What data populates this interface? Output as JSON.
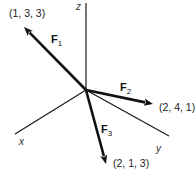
{
  "diagram": {
    "type": "3d-force-vectors",
    "origin": [
      86,
      90
    ],
    "axes": [
      {
        "name": "z",
        "label": "z",
        "end": [
          86,
          3
        ],
        "label_pos": [
          76,
          10
        ]
      },
      {
        "name": "x",
        "label": "x",
        "end": [
          15,
          134
        ],
        "label_pos": [
          19,
          145
        ]
      },
      {
        "name": "y",
        "label": "y",
        "end": [
          169,
          136
        ],
        "label_pos": [
          156,
          152
        ]
      }
    ],
    "vectors": [
      {
        "name": "F1",
        "symbol": "F",
        "subscript": "1",
        "coords": "(1, 3, 3)",
        "end": [
          24,
          27
        ],
        "label_pos": [
          51,
          43
        ],
        "coord_pos": [
          9,
          17
        ]
      },
      {
        "name": "F2",
        "symbol": "F",
        "subscript": "2",
        "coords": "(2, 4, 1)",
        "end": [
          153,
          104
        ],
        "label_pos": [
          120,
          91
        ],
        "coord_pos": [
          159,
          111
        ]
      },
      {
        "name": "F3",
        "symbol": "F",
        "subscript": "3",
        "coords": "(2, 1, 3)",
        "end": [
          106,
          164
        ],
        "label_pos": [
          101,
          133
        ],
        "coord_pos": [
          113,
          167
        ]
      }
    ],
    "colors": {
      "line": "#111111",
      "axis": "#1a1a1a",
      "text": "#222222",
      "background": "#ffffff"
    }
  }
}
